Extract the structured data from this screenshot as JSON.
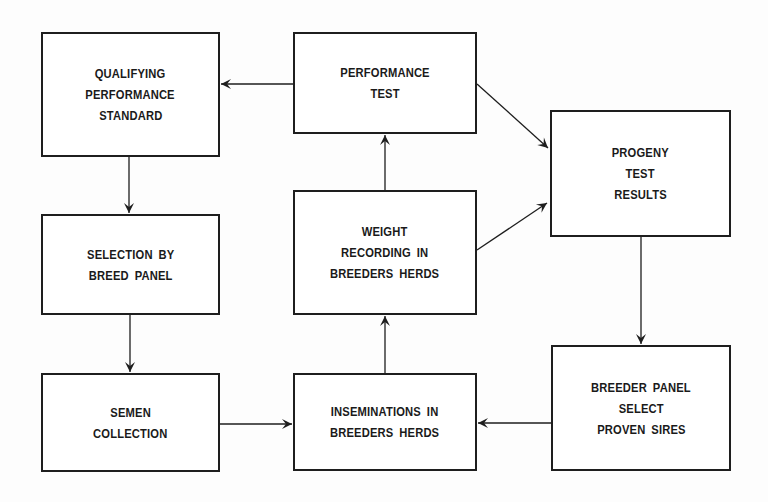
{
  "diagram": {
    "type": "flowchart",
    "nodes": {
      "qualifying": {
        "id": "qualifying",
        "lines": [
          "QUALIFYING",
          "PERFORMANCE",
          "STANDARD"
        ],
        "box": {
          "x": 41,
          "y": 32,
          "w": 179,
          "h": 125
        }
      },
      "performance_test": {
        "id": "performance_test",
        "lines": [
          "PERFORMANCE",
          "TEST"
        ],
        "box": {
          "x": 293,
          "y": 32,
          "w": 184,
          "h": 102
        }
      },
      "progeny": {
        "id": "progeny",
        "lines": [
          "PROGENY",
          "TEST",
          "RESULTS"
        ],
        "box": {
          "x": 550,
          "y": 110,
          "w": 181,
          "h": 127
        }
      },
      "selection": {
        "id": "selection",
        "lines": [
          "SELECTION  BY",
          "BREED PANEL"
        ],
        "box": {
          "x": 41,
          "y": 214,
          "w": 179,
          "h": 101
        }
      },
      "weight": {
        "id": "weight",
        "lines": [
          "WEIGHT",
          "RECORDING  IN",
          "BREEDERS  HERDS"
        ],
        "box": {
          "x": 293,
          "y": 190,
          "w": 184,
          "h": 125
        }
      },
      "semen": {
        "id": "semen",
        "lines": [
          "SEMEN",
          "COLLECTION"
        ],
        "box": {
          "x": 41,
          "y": 373,
          "w": 179,
          "h": 99
        }
      },
      "inseminations": {
        "id": "inseminations",
        "lines": [
          "INSEMINATIONS  IN",
          "BREEDERS  HERDS"
        ],
        "box": {
          "x": 293,
          "y": 373,
          "w": 184,
          "h": 98
        }
      },
      "breeder_panel": {
        "id": "breeder_panel",
        "lines": [
          "BREEDER  PANEL",
          "SELECT",
          "PROVEN  SIRES"
        ],
        "box": {
          "x": 551,
          "y": 345,
          "w": 180,
          "h": 126
        }
      }
    },
    "edges": [
      {
        "from": "performance_test",
        "to": "qualifying",
        "x1": 293,
        "y1": 84,
        "x2": 221,
        "y2": 84
      },
      {
        "from": "qualifying",
        "to": "selection",
        "x1": 129,
        "y1": 157,
        "x2": 129,
        "y2": 213
      },
      {
        "from": "selection",
        "to": "semen",
        "x1": 130,
        "y1": 315,
        "x2": 130,
        "y2": 372
      },
      {
        "from": "semen",
        "to": "inseminations",
        "x1": 220,
        "y1": 424,
        "x2": 292,
        "y2": 424
      },
      {
        "from": "breeder_panel",
        "to": "inseminations",
        "x1": 551,
        "y1": 423,
        "x2": 478,
        "y2": 423
      },
      {
        "from": "inseminations",
        "to": "weight",
        "x1": 385,
        "y1": 373,
        "x2": 385,
        "y2": 316
      },
      {
        "from": "weight",
        "to": "performance_test",
        "x1": 385,
        "y1": 190,
        "x2": 385,
        "y2": 135
      },
      {
        "from": "performance_test",
        "to": "progeny",
        "x1": 477,
        "y1": 84,
        "x2": 548,
        "y2": 148
      },
      {
        "from": "weight",
        "to": "progeny",
        "x1": 477,
        "y1": 250,
        "x2": 547,
        "y2": 203
      },
      {
        "from": "progeny",
        "to": "breeder_panel",
        "x1": 641,
        "y1": 237,
        "x2": 641,
        "y2": 344
      }
    ],
    "colors": {
      "stroke": "#1e1e1e",
      "text": "#1a1a1a",
      "background": "#fdfdfd"
    }
  }
}
